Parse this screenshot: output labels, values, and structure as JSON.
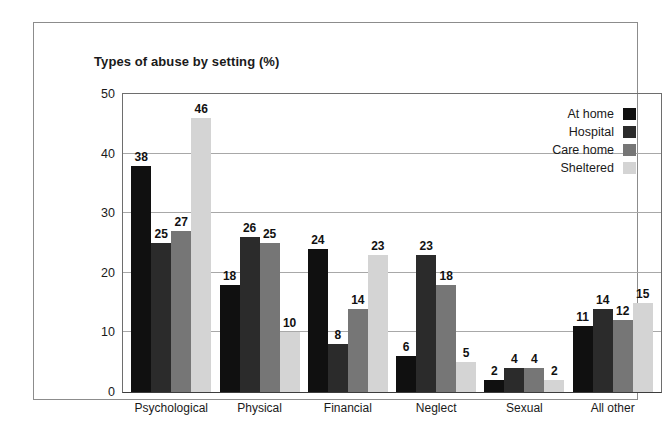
{
  "chart_data": {
    "type": "bar",
    "title": "Types of abuse by setting (%)",
    "xlabel": "",
    "ylabel": "",
    "ylim": [
      0,
      50
    ],
    "yticks": [
      0,
      10,
      20,
      30,
      40,
      50
    ],
    "grid": "horizontal",
    "legend_position": "top-right",
    "categories": [
      "Psychological",
      "Physical",
      "Financial",
      "Neglect",
      "Sexual",
      "All other"
    ],
    "series": [
      {
        "name": "At home",
        "color": "#101010",
        "values": [
          38,
          18,
          24,
          6,
          2,
          11
        ]
      },
      {
        "name": "Hospital",
        "color": "#2b2b2b",
        "values": [
          25,
          26,
          8,
          23,
          4,
          14
        ]
      },
      {
        "name": "Care home",
        "color": "#767676",
        "values": [
          27,
          25,
          14,
          18,
          4,
          12
        ]
      },
      {
        "name": "Sheltered",
        "color": "#d4d4d4",
        "values": [
          46,
          10,
          23,
          5,
          2,
          15
        ]
      }
    ]
  }
}
